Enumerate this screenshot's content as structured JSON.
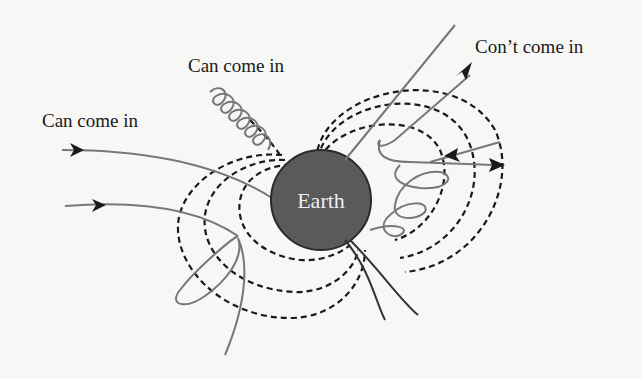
{
  "diagram": {
    "labels": {
      "can_come_in_top": "Can come in",
      "can_come_in_left": "Can come in",
      "cant_come_in": "Con’t come in",
      "earth": "Earth"
    },
    "colors": {
      "background": "#f7f7f5",
      "earth_fill": "#5a5a5a",
      "earth_label": "#eeeeee",
      "field_lines": "#1a1a1a",
      "trajectories": "#777777",
      "text": "#1a1a1a"
    },
    "elements": {
      "earth": "dark grey sphere at center",
      "field_lines": "dashed dipole magnetic field loops around Earth",
      "trajectories": [
        "helical particle spiralling down field line to Earth (upper left)",
        "two arrowed paths entering from left",
        "deflected arrowed paths exiting to upper right and right",
        "looping paths at lower left and lower right",
        "straight lines reaching Earth from bottom"
      ]
    }
  }
}
